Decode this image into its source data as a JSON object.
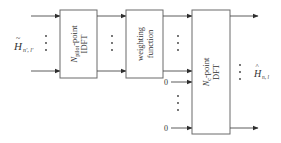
{
  "diagram": {
    "type": "block-diagram",
    "input_label": {
      "main": "H",
      "accent": "~",
      "sub": "n′, l′"
    },
    "output_label": {
      "main": "H",
      "accent": "^",
      "sub": "n, l"
    },
    "blocks": [
      {
        "id": "idft",
        "line1_main": "N",
        "line1_sub": "pilot",
        "line1_rest": "-point",
        "line2": "IDFT"
      },
      {
        "id": "weighting",
        "line1": "weighting",
        "line2": "function"
      },
      {
        "id": "dft",
        "line1_main": "N",
        "line1_sub": "c",
        "line1_rest": "-point",
        "line2": "DFT"
      }
    ],
    "zero_inputs": [
      "0",
      "0"
    ],
    "ellipsis": "⋮",
    "colors": {
      "stroke": "#6b6b6b",
      "text": "#333333",
      "background": "#ffffff"
    }
  }
}
